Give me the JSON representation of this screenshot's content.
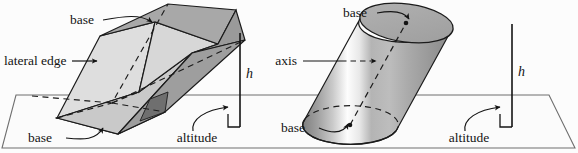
{
  "figure": {
    "background_color": "#fcfcfc",
    "ink_color": "#141414",
    "ground_plane_color": "#fbfbfb",
    "ground_plane_stroke": "#6f6f6f"
  },
  "prism": {
    "name": "oblique prism",
    "labels": {
      "base_top": "base",
      "base_bottom": "base",
      "lateral_edge": "lateral edge",
      "altitude": "altitude",
      "height_symbol": "h"
    },
    "colors": {
      "face_left_light": "#dedede",
      "face_front_mid": "#c9c9c9",
      "face_top": "#a8a8a8",
      "face_right_dark": "#9a9a9a",
      "face_right_darkest": "#7f7f7f",
      "edge": "#1b1b1b"
    }
  },
  "cylinder": {
    "name": "oblique cylinder",
    "labels": {
      "base_top": "base",
      "base_bottom": "base",
      "axis": "axis",
      "altitude": "altitude",
      "height_symbol": "h"
    },
    "colors": {
      "body_dark": "#8e8e8e",
      "body_highlight": "#fdfdfd",
      "body_mid": "#b4b4b4",
      "cap_top": "#a9a9a9",
      "edge": "#1b1b1b"
    }
  },
  "icons": {
    "arrow": "arrow-icon",
    "dashed_axis": "dashed-axis-icon",
    "right_angle": "right-angle-marker-icon"
  }
}
